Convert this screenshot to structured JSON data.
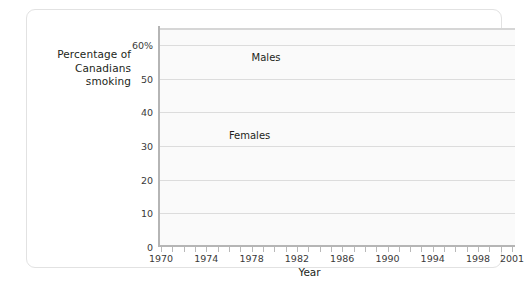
{
  "chart_data": {
    "type": "line",
    "title": "",
    "xlabel": "Year",
    "ylabel": "Percentage of Canadians smoking",
    "ylabel_lines": [
      "Percentage of",
      "Canadians",
      "smoking"
    ],
    "xlim": [
      1970,
      2001
    ],
    "ylim": [
      0,
      65
    ],
    "yticks": [
      0,
      10,
      20,
      30,
      40,
      50,
      60
    ],
    "ytick_labels": [
      "0",
      "10",
      "20",
      "30",
      "40",
      "50",
      "60%"
    ],
    "xticks": [
      1970,
      1974,
      1978,
      1982,
      1986,
      1990,
      1994,
      1998,
      2001
    ],
    "xtick_labels": [
      "1970",
      "1974",
      "1978",
      "1982",
      "1986",
      "1990",
      "1994",
      "1998",
      "2001"
    ],
    "x_minor_tick_step": 1,
    "grid": true,
    "grid_axis": "y",
    "legend": "inline-labels",
    "line_color": "#adadad",
    "line_width_px": 5,
    "x": [
      1970,
      1971,
      1972,
      1973,
      1974,
      1975,
      1976,
      1977,
      1978,
      1979,
      1980,
      1981,
      1982,
      1983,
      1984,
      1985,
      1986,
      1987,
      1988,
      1989,
      1990,
      1991,
      1992,
      1993,
      1994,
      1995,
      1996,
      1997,
      1998,
      1999,
      2000,
      2001
    ],
    "series": [
      {
        "name": "Males",
        "label": "Males",
        "label_x": 1978,
        "label_y": 56,
        "color": "#adadad",
        "values": [
          55,
          54.2,
          53.4,
          52.6,
          52,
          51.2,
          50,
          48.5,
          46.5,
          43,
          44,
          45,
          44.5,
          43.5,
          42.5,
          41,
          39,
          37.5,
          36,
          34,
          31,
          32,
          32,
          31.5,
          31,
          30,
          29,
          28,
          27,
          26,
          24.5,
          23
        ]
      },
      {
        "name": "Females",
        "label": "Females",
        "label_x": 1976,
        "label_y": 33,
        "color": "#adadad",
        "values": [
          38,
          38.3,
          38.6,
          38.8,
          39,
          39.2,
          39.3,
          39.4,
          38.5,
          38.4,
          38.6,
          38.5,
          38.3,
          38,
          37.8,
          36.5,
          35.5,
          34,
          32.5,
          31,
          27.5,
          29.5,
          29.5,
          29.2,
          29,
          28.2,
          27,
          25.5,
          24,
          22.5,
          20.5,
          18.5
        ]
      }
    ]
  }
}
